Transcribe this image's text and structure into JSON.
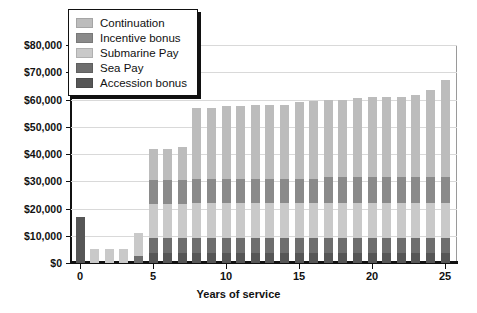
{
  "chart_data": {
    "type": "bar",
    "stacked": true,
    "title": "",
    "subtitle": "",
    "xlabel": "Years of service",
    "ylabel": "",
    "xlim": [
      -0.6,
      25.6
    ],
    "ylim": [
      0,
      80000
    ],
    "grid": true,
    "legend_position": "top-left",
    "y_tick_labels": [
      "$80,000",
      "$70,000",
      "$60,000",
      "$50,000",
      "$40,000",
      "$30,000",
      "$20,000",
      "$10,000",
      "$0"
    ],
    "y_tick_values": [
      80000,
      70000,
      60000,
      50000,
      40000,
      30000,
      20000,
      10000,
      0
    ],
    "x_tick_labels": [
      "0",
      "5",
      "10",
      "15",
      "20",
      "25"
    ],
    "x_tick_values": [
      0,
      5,
      10,
      15,
      20,
      25
    ],
    "categories": [
      0,
      1,
      2,
      3,
      4,
      5,
      6,
      7,
      8,
      9,
      10,
      11,
      12,
      13,
      14,
      15,
      16,
      17,
      18,
      19,
      20,
      21,
      22,
      23,
      24,
      25
    ],
    "series": [
      {
        "name": "Accession bonus",
        "color": "#565656",
        "values": [
          17000,
          0,
          0,
          0,
          0,
          3500,
          3500,
          3500,
          3500,
          3500,
          3500,
          3500,
          3500,
          3500,
          3500,
          3500,
          3500,
          3500,
          3500,
          3500,
          3500,
          3500,
          3500,
          3500,
          3500,
          3500
        ]
      },
      {
        "name": "Sea Pay",
        "color": "#6e6e6e",
        "values": [
          0,
          0,
          0,
          0,
          2500,
          5500,
          5500,
          5500,
          5500,
          5500,
          5500,
          5500,
          5500,
          5500,
          5500,
          5500,
          5500,
          5500,
          5500,
          5500,
          5500,
          5500,
          5500,
          5500,
          5500,
          5500
        ]
      },
      {
        "name": "Submarine Pay",
        "color": "#c9c9c9",
        "values": [
          0,
          5000,
          5000,
          5000,
          8500,
          12500,
          12500,
          12500,
          13000,
          13000,
          13000,
          13000,
          13000,
          13000,
          13000,
          13000,
          13000,
          13000,
          13000,
          13000,
          13000,
          13000,
          13000,
          13000,
          13000,
          13000
        ]
      },
      {
        "name": "Incentive bonus",
        "color": "#8a8a8a",
        "values": [
          0,
          0,
          0,
          0,
          0,
          9000,
          9000,
          9000,
          9000,
          9000,
          9000,
          9000,
          9000,
          9000,
          9000,
          9000,
          9000,
          9500,
          9500,
          9500,
          9500,
          9500,
          9500,
          9500,
          9500,
          9500
        ]
      },
      {
        "name": "Continuation",
        "color": "#bcbcbc",
        "values": [
          0,
          0,
          0,
          0,
          0,
          11500,
          11500,
          12000,
          26000,
          26000,
          26500,
          26500,
          27000,
          27000,
          27000,
          28000,
          28500,
          28500,
          28500,
          29000,
          29500,
          29500,
          29500,
          30000,
          32000,
          35500
        ]
      }
    ],
    "totals": [
      17000,
      5000,
      5000,
      5000,
      11000,
      42000,
      42000,
      42500,
      57000,
      57000,
      57500,
      57500,
      58000,
      58000,
      58000,
      59000,
      59500,
      60000,
      60000,
      60500,
      61000,
      61000,
      61000,
      61500,
      63500,
      67000
    ]
  },
  "legend": {
    "items": [
      {
        "label": "Continuation",
        "color": "#bcbcbc"
      },
      {
        "label": "Incentive bonus",
        "color": "#8a8a8a"
      },
      {
        "label": "Submarine Pay",
        "color": "#c9c9c9"
      },
      {
        "label": "Sea Pay",
        "color": "#6e6e6e"
      },
      {
        "label": "Accession bonus",
        "color": "#565656"
      }
    ]
  }
}
